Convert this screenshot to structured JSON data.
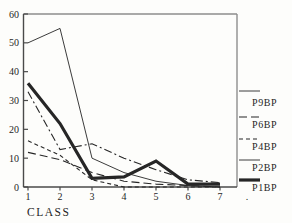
{
  "figure": {
    "xlabel": "CLASS",
    "extra_x_label": ".",
    "background": "#fdfdfb"
  },
  "colors": {
    "axis": "#4a4a4a",
    "box": "#8d8d8d",
    "line": "#262626",
    "text": "#1f1f1f"
  },
  "chart_data": {
    "type": "line",
    "title": "",
    "xlabel": "CLASS",
    "ylabel": "",
    "x": [
      1,
      2,
      3,
      4,
      5,
      6,
      7
    ],
    "x_tick_labels": [
      "1",
      "2",
      "3",
      "4",
      "5",
      "6",
      "7"
    ],
    "y_ticks": [
      0,
      10,
      20,
      30,
      40,
      50,
      60
    ],
    "ylim": [
      0,
      60
    ],
    "xlim": [
      1,
      8
    ],
    "grid": false,
    "legend_position": "right-outside",
    "series": [
      {
        "name": "P9BP",
        "style": "thin-solid",
        "values": [
          50,
          55,
          10,
          5,
          2,
          0.5,
          0
        ]
      },
      {
        "name": "P6BP",
        "style": "dash-dot",
        "values": [
          33,
          13,
          15,
          10,
          6,
          2.5,
          1.5
        ]
      },
      {
        "name": "P4BP",
        "style": "short-dash",
        "values": [
          16,
          11,
          2.5,
          0,
          0,
          0,
          0
        ]
      },
      {
        "name": "P2BP",
        "style": "long-dash",
        "values": [
          12,
          9.5,
          5,
          2,
          1,
          0.5,
          0
        ]
      },
      {
        "name": "P1BP",
        "style": "thick-solid",
        "values": [
          36,
          22,
          3,
          3.5,
          9,
          1,
          1
        ]
      }
    ],
    "legend": [
      {
        "label": "P9BP",
        "sample_style": "thin-solid"
      },
      {
        "label": "P6BP",
        "sample_style": "long-dash"
      },
      {
        "label": "P4BP",
        "sample_style": "short-dash"
      },
      {
        "label": "P2BP",
        "sample_style": "thin-solid"
      },
      {
        "label": "P1BP",
        "sample_style": "thick-solid"
      }
    ]
  }
}
